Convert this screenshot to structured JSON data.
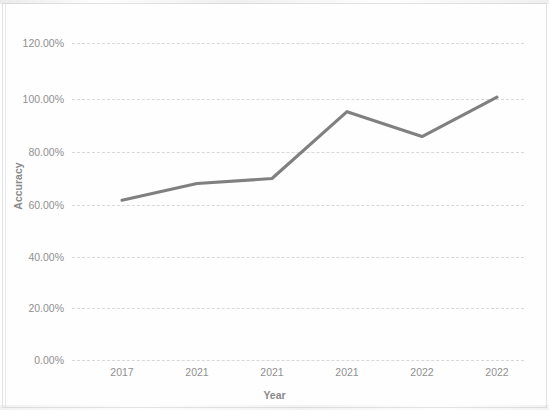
{
  "chart_data": {
    "type": "line",
    "title": "",
    "xlabel": "Year",
    "ylabel": "Accuracy",
    "categories": [
      "2017",
      "2021",
      "2021",
      "2021",
      "2022",
      "2022"
    ],
    "values": [
      60.5,
      66.8,
      68.7,
      94.0,
      84.6,
      99.5
    ],
    "series": [
      {
        "name": "Accuracy",
        "values": [
          60.5,
          66.8,
          68.7,
          94.0,
          84.6,
          99.5
        ],
        "color": "#6e6e6e"
      }
    ],
    "ylim": [
      0,
      120
    ],
    "ytick_labels": [
      "0.00%",
      "20.00%",
      "40.00%",
      "60.00%",
      "80.00%",
      "100.00%",
      "120.00%"
    ],
    "ytick_values": [
      0,
      20,
      40,
      60,
      80,
      100,
      120
    ],
    "xtick_labels": [
      "2017",
      "2021",
      "2021",
      "2021",
      "2022",
      "2022"
    ],
    "grid": true,
    "grid_style": "dashed-horizontal",
    "legend": false,
    "legend_position": "none",
    "value_format": "percent",
    "axis_tick_color": "#909090",
    "gridline_color": "#d8d8d8",
    "background_color": "#ffffff"
  },
  "axes": {
    "y_title": "Accuracy",
    "x_title": "Year",
    "y_ticks": [
      {
        "label": "120.00%",
        "value": 120
      },
      {
        "label": "100.00%",
        "value": 100
      },
      {
        "label": "80.00%",
        "value": 80
      },
      {
        "label": "60.00%",
        "value": 60
      },
      {
        "label": "40.00%",
        "value": 40
      },
      {
        "label": "20.00%",
        "value": 20
      },
      {
        "label": "0.00%",
        "value": 0
      }
    ],
    "x_ticks": [
      {
        "label": "2017"
      },
      {
        "label": "2021"
      },
      {
        "label": "2021"
      },
      {
        "label": "2021"
      },
      {
        "label": "2022"
      },
      {
        "label": "2022"
      }
    ]
  }
}
